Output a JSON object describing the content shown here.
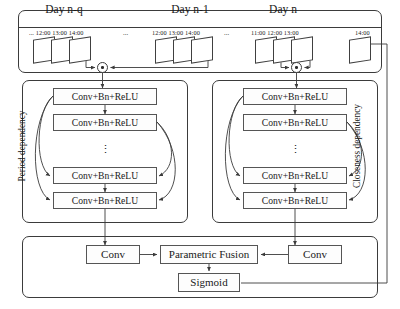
{
  "diagram": {
    "panels": {
      "days": {
        "name": "input-day-sequence"
      },
      "period": {
        "label": "Period dependency"
      },
      "closeness": {
        "label": "Closeness dependency"
      },
      "fusion": {
        "name": "fusion-output"
      }
    },
    "days": [
      {
        "title": "Day n-q",
        "leading_ellipsis": "...",
        "times": "12:00 13:00 14:00",
        "trailing_ellipsis": "...",
        "frame_count": 3
      },
      {
        "title": "Day n-1",
        "leading_ellipsis": "",
        "times": "12:00 13:00 14:00",
        "trailing_ellipsis": "...",
        "frame_count": 3
      },
      {
        "title": "Day n",
        "leading_ellipsis": "",
        "times": "11:00  12:00   13:00",
        "trailing_ellipsis": "",
        "frame_count": 3,
        "target_time": "14:00",
        "target_frame_count": 1
      }
    ],
    "period_block": {
      "label": "Period dependency",
      "layers": [
        "Conv+Bn+ReLU",
        "Conv+Bn+ReLU",
        "Conv+Bn+ReLU",
        "Conv+Bn+ReLU"
      ],
      "ellipsis": "⋮"
    },
    "closeness_block": {
      "label": "Closeness dependency",
      "layers": [
        "Conv+Bn+ReLU",
        "Conv+Bn+ReLU",
        "Conv+Bn+ReLU",
        "Conv+Bn+ReLU"
      ],
      "ellipsis": "⋮"
    },
    "fusion_block": {
      "conv_left": "Conv",
      "parametric_fusion": "Parametric Fusion",
      "conv_right": "Conv",
      "sigmoid": "Sigmoid"
    },
    "operators": {
      "merge_left": "merge",
      "merge_right": "merge"
    },
    "colors": {
      "stroke": "#3b3b3b",
      "box_stroke": "#555555",
      "background": "#ffffff",
      "text": "#1a1a1a"
    }
  }
}
